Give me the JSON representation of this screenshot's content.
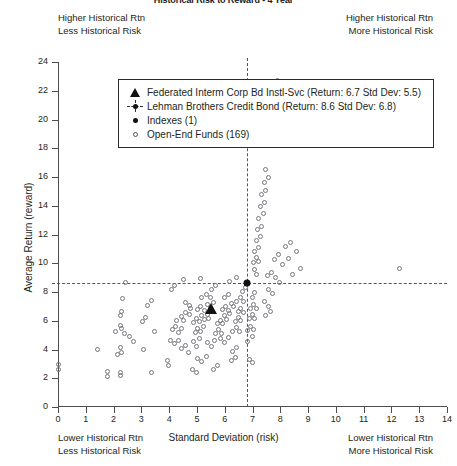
{
  "title": "Historical Risk to Reward - 4 Year",
  "quadrant_notes": {
    "top_left_line1": "Higher Historical Rtn",
    "top_left_line2": "Less Historical Risk",
    "top_right_line1": "Higher Historical Rtn",
    "top_right_line2": "More Historical Risk",
    "bottom_left_line1": "Lower Historical Rtn",
    "bottom_left_line2": "Less Historical Risk",
    "bottom_right_line1": "Lower Historical Rtn",
    "bottom_right_line2": "More Historical Risk"
  },
  "legend": {
    "items": [
      {
        "glyph": "filled-triangle-icon",
        "label": "Federated Interm Corp Bd Instl-Svc (Return: 6.7 Std Dev: 5.5)"
      },
      {
        "glyph": "crosshair-dot-icon",
        "label": "Lehman Brothers Credit Bond (Return: 8.6 Std Dev: 6.8)"
      },
      {
        "glyph": "filled-dot-icon",
        "label": "Indexes (1)"
      },
      {
        "glyph": "open-circle-icon",
        "label": "Open-End Funds (169)"
      }
    ]
  },
  "chart_data": {
    "type": "scatter",
    "title": "Historical Risk to Reward - 4 Year",
    "xlabel": "Standard Deviation (risk)",
    "ylabel": "Average Return (reward)",
    "xlim": [
      0,
      14
    ],
    "ylim": [
      0,
      24
    ],
    "xticks": [
      0,
      1,
      2,
      3,
      4,
      5,
      6,
      7,
      8,
      9,
      10,
      11,
      12,
      13,
      14
    ],
    "yticks": [
      0,
      2,
      4,
      6,
      8,
      10,
      12,
      14,
      16,
      18,
      20,
      22,
      24
    ],
    "grid": false,
    "legend_position": "upper-center-inside",
    "reference_lines": {
      "vertical_x": 6.8,
      "horizontal_y": 8.6,
      "style": "dashed"
    },
    "series": [
      {
        "name": "Open-End Funds (169)",
        "marker": "open-circle",
        "count": 169,
        "points": [
          [
            0.05,
            2.95
          ],
          [
            0.05,
            2.55
          ],
          [
            1.8,
            2.45
          ],
          [
            1.8,
            2.1
          ],
          [
            2.25,
            2.4
          ],
          [
            2.25,
            2.15
          ],
          [
            2.15,
            3.6
          ],
          [
            2.25,
            4.1
          ],
          [
            2.3,
            3.75
          ],
          [
            2.1,
            5.2
          ],
          [
            2.25,
            5.65
          ],
          [
            2.3,
            5.45
          ],
          [
            2.4,
            5.1
          ],
          [
            2.25,
            6.3
          ],
          [
            2.3,
            6.6
          ],
          [
            2.35,
            7.5
          ],
          [
            2.45,
            8.6
          ],
          [
            1.45,
            3.95
          ],
          [
            3.1,
            3.95
          ],
          [
            3.4,
            2.35
          ],
          [
            3.5,
            5.2
          ],
          [
            3.95,
            3.2
          ],
          [
            4.0,
            2.85
          ],
          [
            4.05,
            4.6
          ],
          [
            4.2,
            4.35
          ],
          [
            4.35,
            4.6
          ],
          [
            4.15,
            5.35
          ],
          [
            4.25,
            5.6
          ],
          [
            4.35,
            5.15
          ],
          [
            4.45,
            5.45
          ],
          [
            4.3,
            6.0
          ],
          [
            4.45,
            6.25
          ],
          [
            4.55,
            5.95
          ],
          [
            4.6,
            6.55
          ],
          [
            4.75,
            6.4
          ],
          [
            4.8,
            6.85
          ],
          [
            4.6,
            7.25
          ],
          [
            4.75,
            7.05
          ],
          [
            4.45,
            4.05
          ],
          [
            4.6,
            4.25
          ],
          [
            4.7,
            3.75
          ],
          [
            4.9,
            4.5
          ],
          [
            5.0,
            4.2
          ],
          [
            5.1,
            4.75
          ],
          [
            4.95,
            5.15
          ],
          [
            5.05,
            5.45
          ],
          [
            5.15,
            5.2
          ],
          [
            5.25,
            5.6
          ],
          [
            4.9,
            5.85
          ],
          [
            5.0,
            6.1
          ],
          [
            5.1,
            5.9
          ],
          [
            5.2,
            6.35
          ],
          [
            5.3,
            6.05
          ],
          [
            5.4,
            6.4
          ],
          [
            5.45,
            6.15
          ],
          [
            5.05,
            6.75
          ],
          [
            5.15,
            6.95
          ],
          [
            5.3,
            6.7
          ],
          [
            5.4,
            7.1
          ],
          [
            5.5,
            6.9
          ],
          [
            5.6,
            7.25
          ],
          [
            5.2,
            7.55
          ],
          [
            5.35,
            7.8
          ],
          [
            5.5,
            7.6
          ],
          [
            5.55,
            8.15
          ],
          [
            5.7,
            8.4
          ],
          [
            5.05,
            3.35
          ],
          [
            5.2,
            3.1
          ],
          [
            5.35,
            3.5
          ],
          [
            5.4,
            4.45
          ],
          [
            5.55,
            4.15
          ],
          [
            5.65,
            4.6
          ],
          [
            5.7,
            5.05
          ],
          [
            5.8,
            5.35
          ],
          [
            5.9,
            5.1
          ],
          [
            5.75,
            5.75
          ],
          [
            5.85,
            6.0
          ],
          [
            5.95,
            5.8
          ],
          [
            6.0,
            6.3
          ],
          [
            6.1,
            6.05
          ],
          [
            6.2,
            6.45
          ],
          [
            5.95,
            6.75
          ],
          [
            6.05,
            6.95
          ],
          [
            6.15,
            6.7
          ],
          [
            6.25,
            7.15
          ],
          [
            6.35,
            6.95
          ],
          [
            6.0,
            7.55
          ],
          [
            6.15,
            7.8
          ],
          [
            5.85,
            4.75
          ],
          [
            6.0,
            4.45
          ],
          [
            6.15,
            4.8
          ],
          [
            6.3,
            5.25
          ],
          [
            6.45,
            5.5
          ],
          [
            6.55,
            5.2
          ],
          [
            6.4,
            5.9
          ],
          [
            6.5,
            6.2
          ],
          [
            6.6,
            5.95
          ],
          [
            6.5,
            6.6
          ],
          [
            6.6,
            6.85
          ],
          [
            6.7,
            6.55
          ],
          [
            6.45,
            7.3
          ],
          [
            6.6,
            7.55
          ],
          [
            6.7,
            7.3
          ],
          [
            6.65,
            8.0
          ],
          [
            6.75,
            8.25
          ],
          [
            6.3,
            3.85
          ],
          [
            6.45,
            4.1
          ],
          [
            6.25,
            3.2
          ],
          [
            6.4,
            3.4
          ],
          [
            6.85,
            5.3
          ],
          [
            6.95,
            5.6
          ],
          [
            7.05,
            5.35
          ],
          [
            6.9,
            6.1
          ],
          [
            7.0,
            6.4
          ],
          [
            7.1,
            6.15
          ],
          [
            6.95,
            6.85
          ],
          [
            7.05,
            7.1
          ],
          [
            7.15,
            6.85
          ],
          [
            7.0,
            7.6
          ],
          [
            7.1,
            7.9
          ],
          [
            6.85,
            4.55
          ],
          [
            7.0,
            4.85
          ],
          [
            6.9,
            3.3
          ],
          [
            7.0,
            3.05
          ],
          [
            7.15,
            9.15
          ],
          [
            7.1,
            9.55
          ],
          [
            7.05,
            10.05
          ],
          [
            7.15,
            10.35
          ],
          [
            7.25,
            10.1
          ],
          [
            7.1,
            10.8
          ],
          [
            7.25,
            11.05
          ],
          [
            7.15,
            11.55
          ],
          [
            7.3,
            11.8
          ],
          [
            7.2,
            12.3
          ],
          [
            7.35,
            12.55
          ],
          [
            7.25,
            13.1
          ],
          [
            7.4,
            13.4
          ],
          [
            7.3,
            13.9
          ],
          [
            7.45,
            14.2
          ],
          [
            7.35,
            14.75
          ],
          [
            7.5,
            15.05
          ],
          [
            7.45,
            15.6
          ],
          [
            7.6,
            15.9
          ],
          [
            7.5,
            16.5
          ],
          [
            7.9,
            22.7
          ],
          [
            7.55,
            9.1
          ],
          [
            7.7,
            9.35
          ],
          [
            7.8,
            10.2
          ],
          [
            7.95,
            10.6
          ],
          [
            8.1,
            9.9
          ],
          [
            8.3,
            10.3
          ],
          [
            8.45,
            9.15
          ],
          [
            8.75,
            9.6
          ],
          [
            8.2,
            11.1
          ],
          [
            8.4,
            11.4
          ],
          [
            8.6,
            10.75
          ],
          [
            12.3,
            9.6
          ],
          [
            7.6,
            8.15
          ],
          [
            7.75,
            7.85
          ],
          [
            7.45,
            7.3
          ],
          [
            7.6,
            6.95
          ],
          [
            7.5,
            6.35
          ],
          [
            7.65,
            6.6
          ],
          [
            8.0,
            8.6
          ],
          [
            7.85,
            8.95
          ],
          [
            5.6,
            2.55
          ],
          [
            5.75,
            2.85
          ],
          [
            4.85,
            2.6
          ],
          [
            5.0,
            2.35
          ],
          [
            3.05,
            5.9
          ],
          [
            3.15,
            6.2
          ],
          [
            3.25,
            7.0
          ],
          [
            3.4,
            7.35
          ],
          [
            2.6,
            4.85
          ],
          [
            2.75,
            4.55
          ],
          [
            4.1,
            8.15
          ],
          [
            4.2,
            8.45
          ],
          [
            4.55,
            8.85
          ],
          [
            5.15,
            8.9
          ],
          [
            6.2,
            8.7
          ],
          [
            6.45,
            9.0
          ]
        ]
      },
      {
        "name": "Indexes (1)",
        "marker": "filled-dot",
        "count": 1,
        "points": [
          [
            6.8,
            8.6
          ]
        ],
        "label": "Lehman Brothers Credit Bond"
      },
      {
        "name": "Federated Interm Corp Bd Instl-Svc",
        "marker": "filled-triangle",
        "count": 1,
        "points": [
          [
            5.5,
            6.7
          ]
        ],
        "return": 6.7,
        "std_dev": 5.5
      }
    ]
  }
}
